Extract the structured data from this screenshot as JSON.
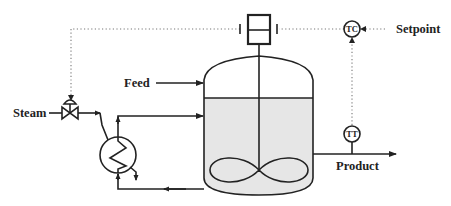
{
  "diagram": {
    "type": "process-flow / P&ID",
    "labels": {
      "feed": "Feed",
      "steam": "Steam",
      "setpoint": "Setpoint",
      "product": "Product"
    },
    "instruments": {
      "temperature_controller": "TC",
      "temperature_transmitter": "TT"
    },
    "components": [
      "stirred-tank-vessel",
      "agitator-motor",
      "impeller",
      "heat-exchanger",
      "steam-control-valve",
      "temperature-controller",
      "temperature-transmitter"
    ],
    "colors": {
      "line": "#222222",
      "signal": "#777777",
      "liquid": "#e6e6e6",
      "background": "#ffffff"
    }
  }
}
